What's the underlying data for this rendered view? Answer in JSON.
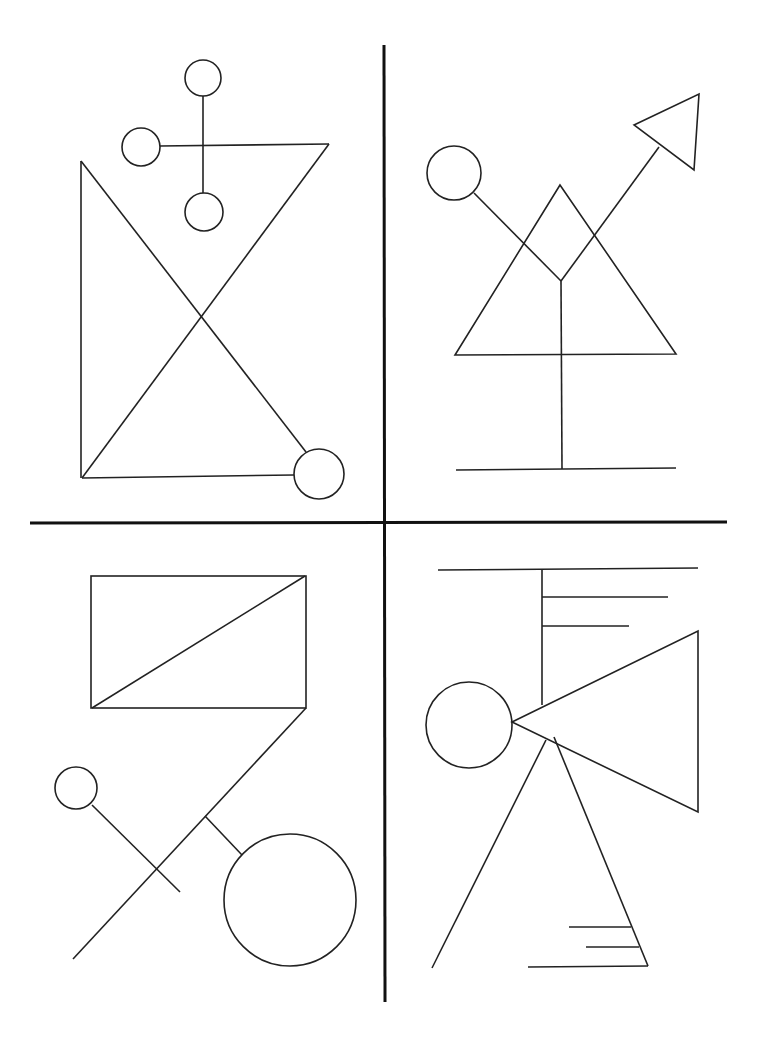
{
  "colors": {
    "background": "#ffffff",
    "stroke": "#222222",
    "divider": "#111111"
  },
  "dividers": {
    "vertical": {
      "x1": 384,
      "y1": 45,
      "x2": 385,
      "y2": 1002
    },
    "horizontal": {
      "x1": 30,
      "y1": 523,
      "x2": 727,
      "y2": 522
    }
  },
  "quadrants": {
    "top_left": {
      "circles": [
        {
          "cx": 203,
          "cy": 78,
          "r": 18
        },
        {
          "cx": 141,
          "cy": 147,
          "r": 19
        },
        {
          "cx": 204,
          "cy": 212,
          "r": 19
        },
        {
          "cx": 319,
          "cy": 474,
          "r": 25
        }
      ],
      "lines": [
        [
          203,
          96,
          203,
          193
        ],
        [
          160,
          146,
          329,
          144
        ],
        [
          329,
          144,
          82,
          478
        ],
        [
          81,
          161,
          81,
          478
        ],
        [
          81,
          161,
          306,
          452
        ],
        [
          82,
          478,
          294,
          475
        ]
      ]
    },
    "top_right": {
      "circles": [
        {
          "cx": 454,
          "cy": 173,
          "r": 27
        }
      ],
      "polygons": [
        [
          [
            560,
            185
          ],
          [
            455,
            355
          ],
          [
            676,
            354
          ]
        ],
        [
          [
            634,
            125
          ],
          [
            699,
            94
          ],
          [
            694,
            170
          ]
        ]
      ],
      "lines": [
        [
          474,
          193,
          561,
          281
        ],
        [
          561,
          281,
          659,
          147
        ],
        [
          561,
          281,
          562,
          469
        ],
        [
          456,
          470,
          676,
          468
        ]
      ]
    },
    "bottom_left": {
      "rect": {
        "x": 91,
        "y": 576,
        "w": 215,
        "h": 132
      },
      "circles": [
        {
          "cx": 76,
          "cy": 788,
          "r": 21
        },
        {
          "cx": 290,
          "cy": 900,
          "r": 66
        }
      ],
      "lines": [
        [
          92,
          708,
          305,
          576
        ],
        [
          306,
          708,
          73,
          959
        ],
        [
          92,
          805,
          180,
          892
        ],
        [
          205,
          816,
          242,
          855
        ]
      ]
    },
    "bottom_right": {
      "circles": [
        {
          "cx": 469,
          "cy": 725,
          "r": 43
        }
      ],
      "polygons": [
        [
          [
            512,
            722
          ],
          [
            698,
            631
          ],
          [
            698,
            812
          ]
        ]
      ],
      "lines": [
        [
          438,
          570,
          698,
          568
        ],
        [
          542,
          570,
          542,
          705
        ],
        [
          542,
          597,
          668,
          597
        ],
        [
          542,
          626,
          629,
          626
        ],
        [
          546,
          740,
          432,
          968
        ],
        [
          554,
          737,
          648,
          966
        ],
        [
          569,
          927,
          631,
          927
        ],
        [
          586,
          947,
          639,
          947
        ],
        [
          528,
          967,
          648,
          966
        ]
      ]
    }
  }
}
